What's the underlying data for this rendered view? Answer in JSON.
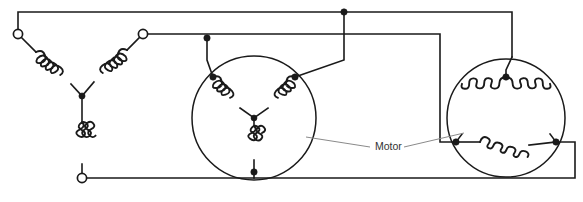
{
  "diagram": {
    "type": "electrical-schematic",
    "background_color": "#ffffff",
    "line_color": "#1a1a1a",
    "leader_color": "#8a8a8a",
    "label_color": "#333333"
  },
  "labels": {
    "motor": "Motor"
  },
  "annotations": {
    "motor_callout_text": "Motor",
    "motor_callout_x": 378,
    "motor_callout_y": 145
  },
  "sections": {
    "left": {
      "name": "supply-wye-network",
      "winding_configuration": "wye",
      "terminal_count": 3,
      "terminals": [
        {
          "name": "terminal-top-left",
          "cx": 18,
          "cy": 34,
          "r": 4.6,
          "style": "open"
        },
        {
          "name": "terminal-top-right",
          "cx": 143,
          "cy": 34,
          "r": 4.6,
          "style": "open"
        },
        {
          "name": "terminal-bottom",
          "cx": 82,
          "cy": 178,
          "r": 4.6,
          "style": "open"
        }
      ],
      "star_point": {
        "cx": 82,
        "cy": 96
      }
    },
    "middle": {
      "name": "motor-wye-winding",
      "winding_configuration": "wye",
      "circle": {
        "cx": 254,
        "cy": 118,
        "r": 62
      },
      "nodes": [
        {
          "name": "node-left",
          "cx": 213,
          "cy": 77
        },
        {
          "name": "node-right",
          "cx": 295,
          "cy": 77
        },
        {
          "name": "node-bottom",
          "cx": 254,
          "cy": 172
        }
      ],
      "star_point": {
        "cx": 254,
        "cy": 118
      }
    },
    "right": {
      "name": "motor-delta-winding",
      "winding_configuration": "delta",
      "circle": {
        "cx": 506,
        "cy": 118,
        "r": 59
      },
      "nodes": [
        {
          "name": "node-apex",
          "cx": 506,
          "cy": 77
        },
        {
          "name": "node-bottom-left",
          "cx": 456,
          "cy": 142
        },
        {
          "name": "node-bottom-right",
          "cx": 556,
          "cy": 142
        }
      ]
    }
  },
  "bus_nodes": [
    {
      "name": "bus-node-top",
      "cx": 344,
      "cy": 12
    },
    {
      "name": "bus-node-second",
      "cx": 207,
      "cy": 38
    }
  ],
  "footer": {
    "cropped_caption": "      "
  }
}
